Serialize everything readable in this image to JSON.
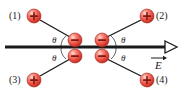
{
  "figure": {
    "background_color": "#ffffff",
    "width": 183,
    "height": 96
  },
  "colors": {
    "charge_fill": "#e8443a",
    "charge_highlight": "#ffd9d2",
    "charge_edge": "#a32318",
    "line": "#1a1a1a",
    "text": "#1a1a1a"
  },
  "axis": {
    "name": "electric-field-axis",
    "label": "E",
    "has_vector_arrow": true,
    "arrowhead_style": "open-triangle",
    "direction": "right",
    "y": 47,
    "x_start": 5,
    "x_end": 176
  },
  "positive_charges": [
    {
      "id": "1",
      "label": "(1)",
      "sign": "+",
      "cx": 34,
      "cy": 16,
      "r": 7,
      "label_side": "left",
      "label_x": 9,
      "label_y": 11
    },
    {
      "id": "2",
      "label": "(2)",
      "sign": "+",
      "cx": 147,
      "cy": 16,
      "r": 7,
      "label_side": "right",
      "label_x": 156,
      "label_y": 11
    },
    {
      "id": "3",
      "label": "(3)",
      "sign": "+",
      "cx": 34,
      "cy": 80,
      "r": 7,
      "label_side": "left",
      "label_x": 9,
      "label_y": 75
    },
    {
      "id": "4",
      "label": "(4)",
      "sign": "+",
      "cx": 147,
      "cy": 80,
      "r": 7,
      "label_side": "right",
      "label_x": 156,
      "label_y": 75
    }
  ],
  "negative_charges": [
    {
      "id": "n1",
      "sign": "−",
      "cx": 75,
      "cy": 40,
      "r": 7
    },
    {
      "id": "n2",
      "sign": "−",
      "cx": 102,
      "cy": 40,
      "r": 7
    },
    {
      "id": "n3",
      "sign": "−",
      "cx": 75,
      "cy": 56,
      "r": 7
    },
    {
      "id": "n4",
      "sign": "−",
      "cx": 102,
      "cy": 56,
      "r": 7
    }
  ],
  "connector_lines": [
    {
      "name": "line-1-to-upper-left-negative",
      "x1": 40,
      "y1": 20,
      "x2": 70,
      "y2": 37
    },
    {
      "name": "line-2-to-upper-right-negative",
      "x1": 141,
      "y1": 20,
      "x2": 107,
      "y2": 37
    },
    {
      "name": "line-3-to-lower-left-negative",
      "x1": 40,
      "y1": 76,
      "x2": 70,
      "y2": 59
    },
    {
      "name": "line-4-to-lower-right-negative",
      "x1": 141,
      "y1": 76,
      "x2": 107,
      "y2": 59
    }
  ],
  "angle_labels": [
    {
      "name": "theta-upper-left",
      "symbol": "θ",
      "x": 52,
      "y": 36
    },
    {
      "name": "theta-upper-right",
      "symbol": "θ",
      "x": 121,
      "y": 36
    },
    {
      "name": "theta-lower-left",
      "symbol": "θ",
      "x": 52,
      "y": 54
    },
    {
      "name": "theta-lower-right",
      "symbol": "θ",
      "x": 121,
      "y": 54
    }
  ],
  "angle_arcs": [
    {
      "name": "arc-upper-left",
      "path": "M 66 36 A 14 14 0 0 0 61 47"
    },
    {
      "name": "arc-lower-left",
      "path": "M 61 47 A 14 14 0 0 0 66 59"
    },
    {
      "name": "arc-upper-right",
      "path": "M 111 36 A 14 14 0 0 1 116 47"
    },
    {
      "name": "arc-lower-right",
      "path": "M 116 47 A 14 14 0 0 1 111 59"
    }
  ],
  "efield_label": {
    "name": "efield-label",
    "text": "E",
    "x": 152,
    "y": 60
  }
}
